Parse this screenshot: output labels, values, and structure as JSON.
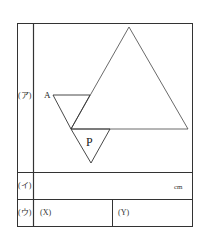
{
  "table": {
    "rows": [
      {
        "label": "(ア)",
        "content": "diagram"
      },
      {
        "label": "(イ)",
        "unit": "cm"
      },
      {
        "label": "(ウ)",
        "cells": [
          "(X)",
          "(Y)"
        ]
      }
    ]
  },
  "diagram": {
    "point_a_label": "A",
    "triangle_p_label": "P",
    "large_triangle": [
      [
        129,
        27
      ],
      [
        71,
        129
      ],
      [
        188,
        129
      ]
    ],
    "small_triangle_a": [
      [
        53,
        95
      ],
      [
        90,
        95
      ],
      [
        71,
        129
      ]
    ],
    "triangle_p": [
      [
        71,
        129
      ],
      [
        110,
        129
      ],
      [
        91,
        163
      ]
    ]
  },
  "colors": {
    "line": "#333333",
    "background": "#ffffff"
  }
}
